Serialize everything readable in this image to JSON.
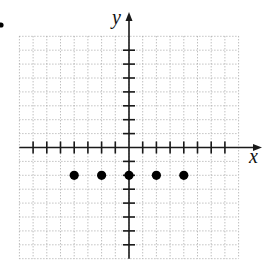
{
  "chart_data": {
    "type": "scatter",
    "title": "",
    "xlabel": "x",
    "ylabel": "y",
    "xlim": [
      -8,
      8
    ],
    "ylim": [
      -8,
      8
    ],
    "grid": true,
    "grid_step": 1,
    "tick_step": 1,
    "tick_labels": false,
    "legend": null,
    "series": [
      {
        "name": "points",
        "points": [
          {
            "x": -4,
            "y": -2
          },
          {
            "x": -2,
            "y": -2
          },
          {
            "x": 0,
            "y": -2
          },
          {
            "x": 2,
            "y": -2
          },
          {
            "x": 4,
            "y": -2
          }
        ]
      }
    ]
  },
  "labels": {
    "x_axis": "x",
    "y_axis": "y"
  },
  "colors": {
    "grid": "#9a9a9a",
    "axis": "#1a1a1a",
    "point": "#000000"
  }
}
